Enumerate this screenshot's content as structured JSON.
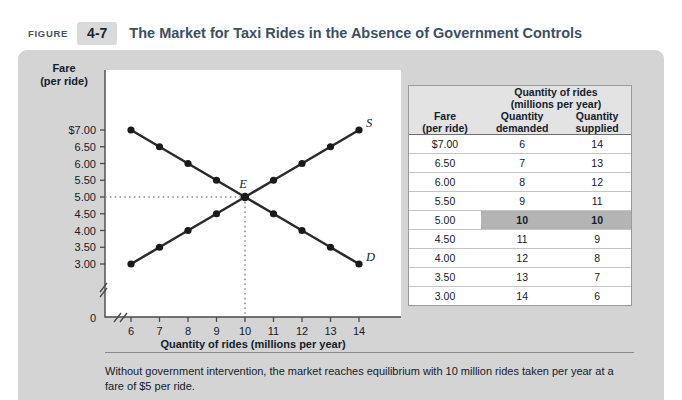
{
  "header": {
    "figure_word": "FIGURE",
    "figure_number": "4-7",
    "title": "The Market for Taxi Rides in the Absence of Government Controls",
    "title_color": "#3d4f63",
    "number_box_color": "#d8dadc"
  },
  "chart_data": {
    "type": "line",
    "title": "",
    "xlabel": "Quantity of rides (millions per year)",
    "ylabel": "Fare (per ride)",
    "ylabel_line1": "Fare",
    "ylabel_line2": "(per ride)",
    "x": [
      6,
      7,
      8,
      9,
      10,
      11,
      12,
      13,
      14
    ],
    "xtick_labels": [
      "6",
      "7",
      "8",
      "9",
      "10",
      "11",
      "12",
      "13",
      "14"
    ],
    "origin_label": "0",
    "ytick_labels": [
      "$7.00",
      "6.50",
      "6.00",
      "5.50",
      "5.00",
      "4.50",
      "4.00",
      "3.50",
      "3.00"
    ],
    "ytick_values": [
      7.0,
      6.5,
      6.0,
      5.5,
      5.0,
      4.5,
      4.0,
      3.5,
      3.0
    ],
    "ylim": [
      3.0,
      7.0
    ],
    "xlim": [
      6,
      14
    ],
    "axis_break": true,
    "grid": false,
    "legend": "inline-labels",
    "series": [
      {
        "name": "Demand",
        "label": "D",
        "values": [
          7.0,
          6.5,
          6.0,
          5.5,
          5.0,
          4.5,
          4.0,
          3.5,
          3.0
        ]
      },
      {
        "name": "Supply",
        "label": "S",
        "values": [
          3.0,
          3.5,
          4.0,
          4.5,
          5.0,
          5.5,
          6.0,
          6.5,
          7.0
        ]
      }
    ],
    "equilibrium": {
      "label": "E",
      "quantity": 10,
      "fare": 5.0,
      "guides": "dotted"
    },
    "curve_color": "#2b2b2b",
    "guide_color": "#8d8d8d"
  },
  "table": {
    "col_fare_line1": "Fare",
    "col_fare_line2": "(per ride)",
    "group_header_line1": "Quantity of rides",
    "group_header_line2": "(millions per year)",
    "col_demanded_line1": "Quantity",
    "col_demanded_line2": "demanded",
    "col_supplied_line1": "Quantity",
    "col_supplied_line2": "supplied",
    "highlight_color": "#b4b4b4",
    "rows": [
      {
        "fare": "$7.00",
        "demanded": "6",
        "supplied": "14",
        "highlight": false
      },
      {
        "fare": "6.50",
        "demanded": "7",
        "supplied": "13",
        "highlight": false
      },
      {
        "fare": "6.00",
        "demanded": "8",
        "supplied": "12",
        "highlight": false
      },
      {
        "fare": "5.50",
        "demanded": "9",
        "supplied": "11",
        "highlight": false
      },
      {
        "fare": "5.00",
        "demanded": "10",
        "supplied": "10",
        "highlight": true
      },
      {
        "fare": "4.50",
        "demanded": "11",
        "supplied": "9",
        "highlight": false
      },
      {
        "fare": "4.00",
        "demanded": "12",
        "supplied": "8",
        "highlight": false
      },
      {
        "fare": "3.50",
        "demanded": "13",
        "supplied": "7",
        "highlight": false
      },
      {
        "fare": "3.00",
        "demanded": "14",
        "supplied": "6",
        "highlight": false
      }
    ]
  },
  "footer": {
    "caption": "Without government intervention, the market reaches equilibrium with 10 million rides taken per year at a fare of $5 per ride."
  }
}
